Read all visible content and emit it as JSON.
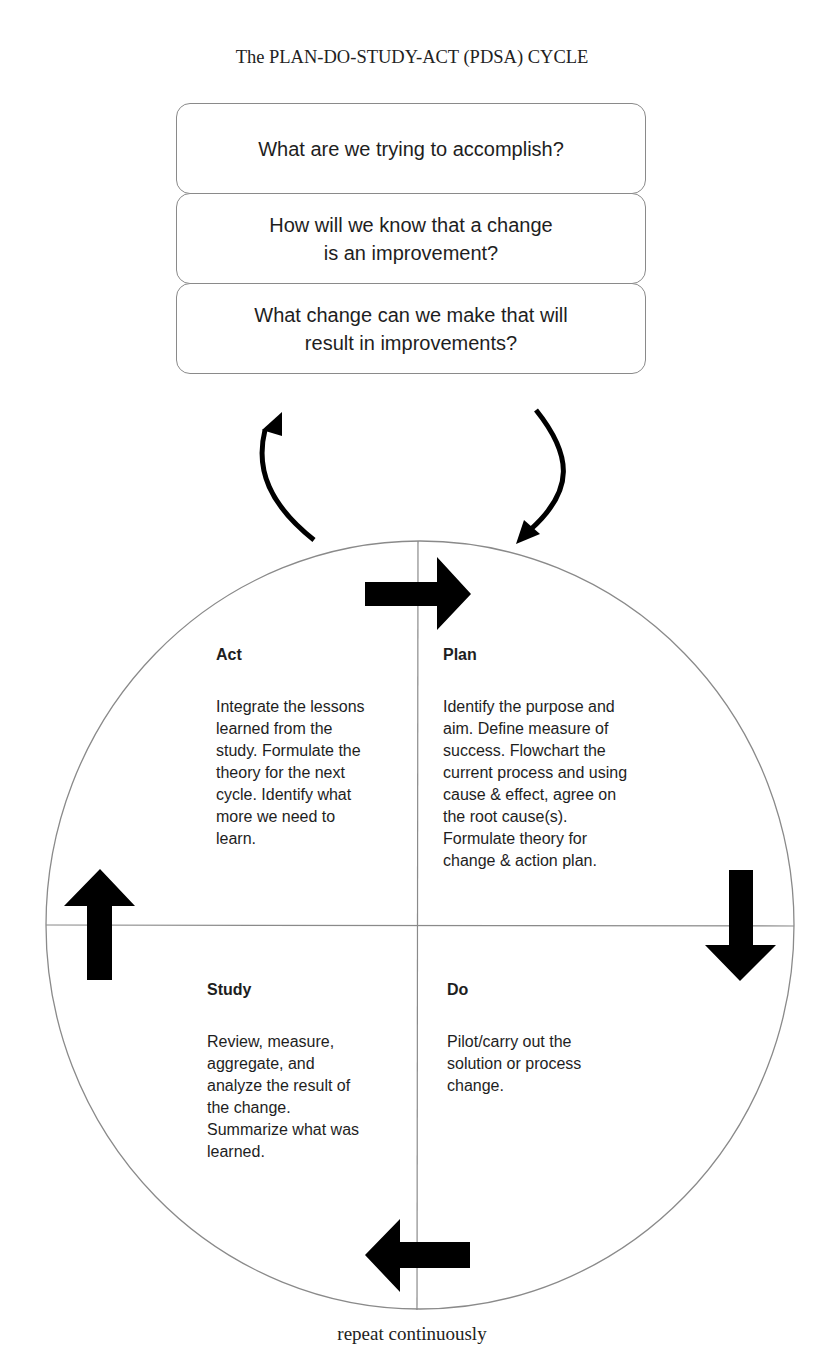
{
  "title": "The PLAN-DO-STUDY-ACT (PDSA) CYCLE",
  "questions": [
    {
      "text": "What are we trying to accomplish?"
    },
    {
      "text": "How will we know that a change\nis an improvement?"
    },
    {
      "text": "What change can we make that will\nresult in improvements?"
    }
  ],
  "quadrants": {
    "act": {
      "heading": "Act",
      "body": "Integrate the lessons\nlearned from the\nstudy.  Formulate the\ntheory for the next\ncycle.  Identify what\nmore we need to\nlearn."
    },
    "plan": {
      "heading": "Plan",
      "body": "Identify the purpose and\naim.  Define measure of\nsuccess. Flowchart the\ncurrent process and using\ncause & effect, agree on\nthe root cause(s).\nFormulate theory for\nchange & action plan."
    },
    "study": {
      "heading": "Study",
      "body": "Review, measure,\naggregate, and\nanalyze the result of\nthe change.\nSummarize what was\nlearned."
    },
    "do": {
      "heading": "Do",
      "body": "Pilot/carry out the\nsolution or process\nchange."
    }
  },
  "arrows": {
    "top": "arrow-right-icon",
    "right": "arrow-down-icon",
    "bottom": "arrow-left-icon",
    "left": "arrow-up-icon",
    "curved_left": "curved-arrow-up-icon",
    "curved_right": "curved-arrow-down-icon"
  },
  "footer": "repeat continuously",
  "colors": {
    "arrow": "#000000",
    "line": "#8a8a8a",
    "text": "#1e1e1e"
  }
}
